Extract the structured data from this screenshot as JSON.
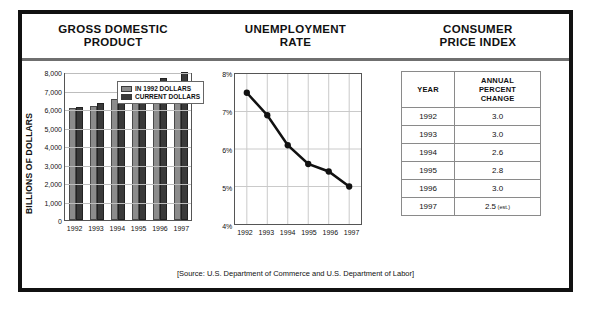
{
  "headers": {
    "gdp": "GROSS DOMESTIC\nPRODUCT",
    "gdp_line1": "GROSS DOMESTIC",
    "gdp_line2": "PRODUCT",
    "unemployment_line1": "UNEMPLOYMENT",
    "unemployment_line2": "RATE",
    "cpi_line1": "CONSUMER",
    "cpi_line2": "PRICE INDEX"
  },
  "source": "[Source: U.S. Department of Commerce and U.S. Department of Labor]",
  "cpi_table": {
    "columns": [
      "YEAR",
      "ANNUAL\nPERCENT\nCHANGE"
    ],
    "col1": "YEAR",
    "col2_line1": "ANNUAL",
    "col2_line2": "PERCENT",
    "col2_line3": "CHANGE",
    "rows": [
      {
        "year": "1992",
        "value": "3.0",
        "note": ""
      },
      {
        "year": "1993",
        "value": "3.0",
        "note": ""
      },
      {
        "year": "1994",
        "value": "2.6",
        "note": ""
      },
      {
        "year": "1995",
        "value": "2.8",
        "note": ""
      },
      {
        "year": "1996",
        "value": "3.0",
        "note": ""
      },
      {
        "year": "1997",
        "value": "2.5",
        "note": "(est.)"
      }
    ]
  },
  "chart_data": [
    {
      "type": "bar",
      "title": "GROSS DOMESTIC PRODUCT",
      "xlabel": "",
      "ylabel": "BILLIONS OF DOLLARS",
      "categories": [
        "1992",
        "1993",
        "1994",
        "1995",
        "1996",
        "1997"
      ],
      "ylim": [
        0,
        8000
      ],
      "yticks": [
        "0",
        "1,000",
        "2,000",
        "3,000",
        "4,000",
        "5,000",
        "6,000",
        "7,000",
        "8,000"
      ],
      "grid": true,
      "legend_position": "top-left",
      "series": [
        {
          "name": "IN 1992 DOLLARS",
          "color": "#8c8c8c",
          "values": [
            6050,
            6150,
            6550,
            6750,
            6900,
            7000
          ]
        },
        {
          "name": "CURRENT DOLLARS",
          "color": "#3a3a3a",
          "values": [
            6100,
            6350,
            6950,
            7100,
            7650,
            8000
          ]
        }
      ]
    },
    {
      "type": "line",
      "title": "UNEMPLOYMENT RATE",
      "xlabel": "",
      "ylabel": "",
      "x": [
        "1992",
        "1993",
        "1994",
        "1995",
        "1996",
        "1997"
      ],
      "ylim": [
        4,
        8
      ],
      "yticks": [
        "4%",
        "5%",
        "6%",
        "7%",
        "8%"
      ],
      "grid": true,
      "legend_position": "none",
      "series": [
        {
          "name": "Unemployment rate",
          "color": "#111111",
          "values": [
            7.5,
            6.9,
            6.1,
            5.6,
            5.4,
            5.0
          ]
        }
      ]
    },
    {
      "type": "table",
      "title": "CONSUMER PRICE INDEX",
      "columns": [
        "YEAR",
        "ANNUAL PERCENT CHANGE"
      ],
      "rows": [
        [
          "1992",
          "3.0"
        ],
        [
          "1993",
          "3.0"
        ],
        [
          "1994",
          "2.6"
        ],
        [
          "1995",
          "2.8"
        ],
        [
          "1996",
          "3.0"
        ],
        [
          "1997",
          "2.5 (est.)"
        ]
      ]
    }
  ]
}
